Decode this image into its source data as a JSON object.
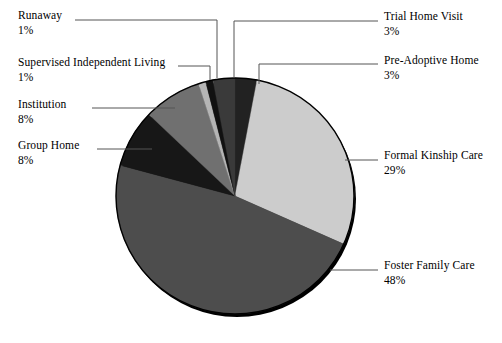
{
  "chart_data": {
    "type": "pie",
    "title": "",
    "subtitle": "",
    "xlabel": "",
    "ylabel": "",
    "legend_position": "none",
    "grid": false,
    "value_unit": "%",
    "center": {
      "cx": 235,
      "cy": 196
    },
    "radius": {
      "rx": 119,
      "ry": 118
    },
    "start_angle_deg": -90,
    "direction": "clockwise",
    "categories": [
      "Trial Home Visit",
      "Formal Kinship Care",
      "Foster Family Care",
      "Group Home",
      "Institution",
      "Supervised Independent Living",
      "Runaway",
      "Pre-Adoptive Home"
    ],
    "values": [
      3,
      29,
      48,
      8,
      8,
      1,
      1,
      3
    ],
    "slices": [
      {
        "label": "Trial Home Visit",
        "value": 3,
        "pct_text": "3%",
        "color": "#222222"
      },
      {
        "label": "Formal Kinship Care",
        "value": 29,
        "pct_text": "29%",
        "color": "#cccccc"
      },
      {
        "label": "Foster Family Care",
        "value": 48,
        "pct_text": "48%",
        "color": "#4d4d4d"
      },
      {
        "label": "Group Home",
        "value": 8,
        "pct_text": "8%",
        "color": "#171717"
      },
      {
        "label": "Institution",
        "value": 8,
        "pct_text": "8%",
        "color": "#707070"
      },
      {
        "label": "Supervised Independent Living",
        "value": 1,
        "pct_text": "1%",
        "color": "#b5b5b5"
      },
      {
        "label": "Runaway",
        "value": 1,
        "pct_text": "1%",
        "color": "#111111"
      },
      {
        "label": "Pre-Adoptive Home",
        "value": 3,
        "pct_text": "3%",
        "color": "#3a3a3a"
      }
    ]
  },
  "labels": {
    "runaway": {
      "name": "Runaway",
      "pct": "1%"
    },
    "sil": {
      "name": "Supervised Independent Living",
      "pct": "1%"
    },
    "institution": {
      "name": "Institution",
      "pct": "8%"
    },
    "group_home": {
      "name": "Group Home",
      "pct": "8%"
    },
    "trial_home": {
      "name": "Trial Home Visit",
      "pct": "3%"
    },
    "pre_adoptive": {
      "name": "Pre-Adoptive Home",
      "pct": "3%"
    },
    "formal_kinship": {
      "name": "Formal Kinship Care",
      "pct": "29%"
    },
    "foster_family": {
      "name": "Foster Family Care",
      "pct": "48%"
    }
  },
  "style": {
    "background": "#ffffff",
    "text_color": "#000000",
    "leader_line_color": "#555555",
    "pie_outline_color": "#000000",
    "pie_shadow_color": "#000000"
  }
}
